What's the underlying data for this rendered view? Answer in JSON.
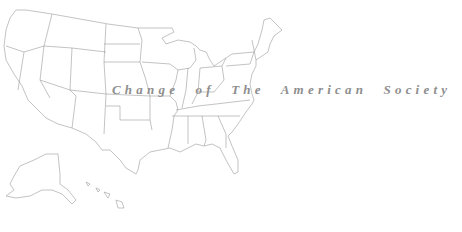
{
  "title": "Change of The American Society",
  "map": {
    "subject": "United States outline map",
    "regions": [
      "contiguous-us",
      "alaska",
      "hawaii"
    ],
    "stroke_color": "#9a9a9a",
    "background": "#ffffff"
  },
  "colors": {
    "title_text": "#8e8e8e"
  }
}
